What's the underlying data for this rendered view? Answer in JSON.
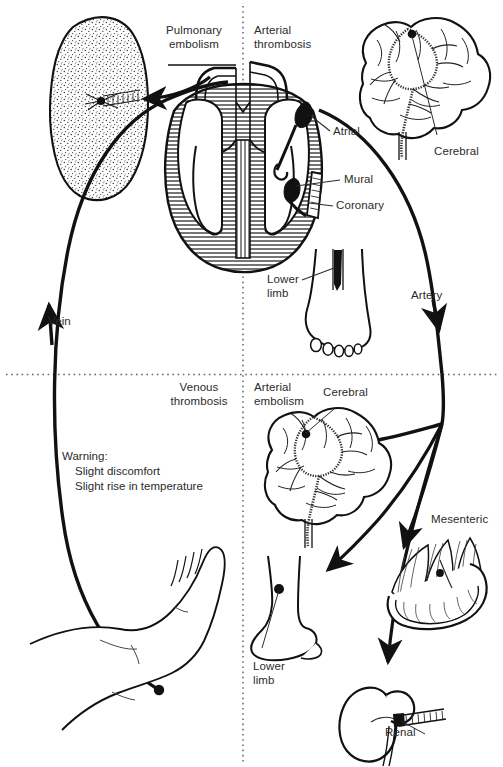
{
  "figure": {
    "title_quadrants": {
      "top_left": "Pulmonary\nembolism",
      "top_right": "Arterial\nthrombosis",
      "bottom_left": "Venous\nthrombosis",
      "bottom_right": "Arterial\nembolism"
    },
    "labels": {
      "pulmonary_embolism": "Pulmonary\nembolism",
      "arterial_thrombosis": "Arterial\nthrombosis",
      "venous_thrombosis": "Venous\nthrombosis",
      "arterial_embolism": "Arterial\nembolism",
      "atrial": "Atrial",
      "mural": "Mural",
      "coronary": "Coronary",
      "cerebral_top": "Cerebral",
      "cerebral_bottom": "Cerebral",
      "lower_limb_top": "Lower\nlimb",
      "lower_limb_bottom": "Lower\nlimb",
      "artery": "Artery",
      "vein": "Vein",
      "mesenteric": "Mesenteric",
      "renal": "Renal"
    },
    "warning": {
      "heading": "Warning:",
      "line1": "Slight discomfort",
      "line2": "Slight rise in temperature"
    },
    "colors": {
      "ink": "#111111",
      "text": "#2b2b2b",
      "divider": "#555555",
      "paper": "#ffffff",
      "hatch": "#4a4a4a"
    },
    "organs": [
      "lung",
      "heart",
      "brain-upper",
      "foot-front-upper",
      "brain-lower",
      "foot-side-lower",
      "leg-foot-lower-left",
      "intestine-mesenteric",
      "kidney-renal"
    ]
  }
}
